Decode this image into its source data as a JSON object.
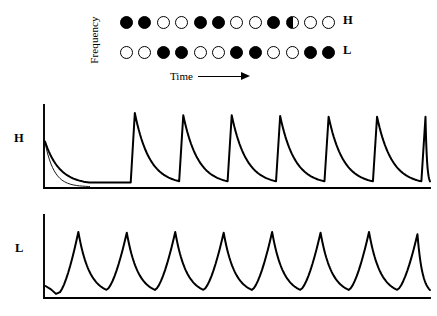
{
  "figure": {
    "stimulus": {
      "y_axis_label": "Frequency",
      "x_axis_label": "Time",
      "x_axis_arrow": "right-arrow",
      "rows": [
        {
          "label": "H",
          "name": "high-frequency-stimulus-row",
          "circles": [
            "filled",
            "filled",
            "open",
            "open",
            "filled",
            "filled",
            "open",
            "open",
            "filled",
            "half",
            "open",
            "open"
          ]
        },
        {
          "label": "L",
          "name": "low-frequency-stimulus-row",
          "circles": [
            "open",
            "open",
            "filled",
            "filled",
            "open",
            "open",
            "filled",
            "filled",
            "open",
            "open",
            "filled",
            "filled"
          ]
        }
      ]
    },
    "panels": [
      {
        "label": "H",
        "name": "high-frequency-response-panel",
        "peak_count": 8,
        "waveform": "sawtooth-sharp-rise-exponential-decay"
      },
      {
        "label": "L",
        "name": "low-frequency-response-panel",
        "peak_count": 8,
        "waveform": "sawtooth-gradual-rise-exponential-decay"
      }
    ]
  },
  "chart_data": {
    "type": "line",
    "title": "",
    "xlabel": "Time",
    "ylabel": "Frequency",
    "grid": false,
    "legend": "none",
    "stimulus_sequence": {
      "description": "Two-tone alternating stimulus train; filled = tone present, open = tone absent, half = partial",
      "H_row": [
        "filled",
        "filled",
        "open",
        "open",
        "filled",
        "filled",
        "open",
        "open",
        "filled",
        "half",
        "open",
        "open"
      ],
      "L_row": [
        "open",
        "open",
        "filled",
        "filled",
        "open",
        "open",
        "filled",
        "filled",
        "open",
        "open",
        "filled",
        "filled"
      ],
      "n_elements": 12
    },
    "series": [
      {
        "name": "H",
        "description": "High-frequency channel response: 8 sawtooth cycles, steep onset, exponential decay",
        "peaks_x": [
          0.0,
          0.135,
          0.26,
          0.385,
          0.51,
          0.635,
          0.76,
          0.885
        ],
        "peaks_y": [
          0.62,
          1.0,
          0.97,
          0.97,
          0.96,
          0.95,
          0.95,
          0.95
        ],
        "troughs_y": [
          0.04,
          0.05,
          0.05,
          0.05,
          0.05,
          0.05,
          0.05,
          0.05
        ],
        "ylim": [
          0,
          1
        ],
        "xlim": [
          0,
          1
        ]
      },
      {
        "name": "L",
        "description": "Low-frequency channel response: 8 sawtooth cycles, gradual onset ramp, exponential decay",
        "peaks_x": [
          0.09,
          0.215,
          0.34,
          0.465,
          0.59,
          0.715,
          0.84,
          0.965
        ],
        "peaks_y": [
          0.88,
          0.87,
          0.88,
          0.87,
          0.88,
          0.87,
          0.88,
          0.85
        ],
        "troughs_y": [
          0.06,
          0.04,
          0.04,
          0.04,
          0.04,
          0.04,
          0.04,
          0.04
        ],
        "ylim": [
          0,
          1
        ],
        "xlim": [
          0,
          1
        ]
      }
    ]
  }
}
